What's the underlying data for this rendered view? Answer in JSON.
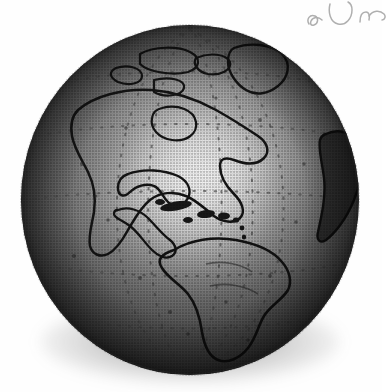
{
  "image": {
    "kind": "halftone-grayscale-illustration",
    "subject": "Earth globe, Western Hemisphere",
    "background_color": "#ffffff",
    "width": 382,
    "height": 392
  },
  "globe": {
    "center_x": 190,
    "center_y": 200,
    "radius_x": 170,
    "radius_y": 176,
    "ocean_color_dark": "#4a4a4a",
    "ocean_color_mid": "#7d7d7d",
    "highlight_color": "#ffffff",
    "limb_color": "#2e2e2e",
    "coastline_color": "#1a1a1a",
    "highlight_center_x": 200,
    "highlight_center_y": 186,
    "landmasses": [
      "North America",
      "Greenland",
      "Canadian Arctic Archipelago",
      "Central America",
      "Caribbean Islands",
      "Cuba",
      "South America",
      "West Africa"
    ]
  },
  "graticule": {
    "style": "dotted",
    "color": "#5a5a5a",
    "equator_label": "equator",
    "meridians": 5,
    "parallels": 4
  },
  "shadow": {
    "type": "drop-shadow",
    "color": "#3a3a3a",
    "position": "bottom"
  },
  "annotation": {
    "type": "handwriting",
    "medium": "pencil",
    "color": "#9a9a9a",
    "text": "ℳℴ",
    "note": "illegible cursive, clipped at right page edge"
  }
}
